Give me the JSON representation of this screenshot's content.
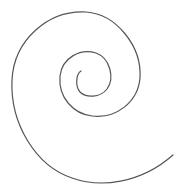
{
  "diagram": {
    "title": "",
    "shape": "spiral",
    "stroke_color": "#555555",
    "background": "#ffffff"
  }
}
